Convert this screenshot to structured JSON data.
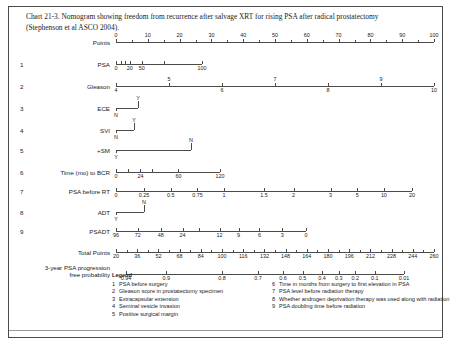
{
  "caption": "Chart 21-3. Nomogram showing freedom from recurrence after salvage XRT for rising PSA after radical prostatectomy (Stephenson et al ASCO 2004).",
  "chart_data": {
    "type": "nomogram",
    "title": "Nomogram showing freedom from recurrence after salvage XRT for rising PSA after radical prostatectomy",
    "source": "Stephenson et al ASCO 2004",
    "axes": [
      {
        "index": "",
        "label": "Points",
        "kind": "scale",
        "ticks_major": [
          0,
          10,
          20,
          30,
          40,
          50,
          60,
          70,
          80,
          90,
          100
        ],
        "tick_labels": [
          "0",
          "10",
          "20",
          "30",
          "40",
          "50",
          "60",
          "70",
          "80",
          "90",
          "100"
        ],
        "minor_step": 5,
        "label_side": "above"
      },
      {
        "index": "1",
        "label": "PSA",
        "kind": "scale",
        "tick_labels": [
          "0",
          "20",
          "50",
          "100"
        ],
        "label_side": "below"
      },
      {
        "index": "2",
        "label": "Gleason",
        "kind": "scale",
        "tick_labels": [
          "4",
          "6",
          "8",
          "10"
        ],
        "tick_labels_above": [
          "5",
          "7",
          "9"
        ],
        "label_side": "below"
      },
      {
        "index": "3",
        "label": "ECE",
        "kind": "binary",
        "low_label": "N",
        "high_label": "Y"
      },
      {
        "index": "4",
        "label": "SVI",
        "kind": "binary",
        "low_label": "N",
        "high_label": "Y"
      },
      {
        "index": "5",
        "label": "+SM",
        "kind": "binary",
        "low_label": "Y",
        "high_label": "N"
      },
      {
        "index": "6",
        "label": "Time (mo) to BCR",
        "kind": "scale",
        "tick_labels": [
          "0",
          "24",
          "60",
          "120"
        ],
        "label_side": "below"
      },
      {
        "index": "7",
        "label": "PSA before RT",
        "kind": "scale",
        "tick_labels": [
          "0",
          "0.25",
          "0.5",
          "0.75",
          "1",
          "1.5",
          "2",
          "3",
          "5",
          "10",
          "20"
        ],
        "label_side": "below"
      },
      {
        "index": "8",
        "label": "ADT",
        "kind": "binary",
        "low_label": "Y",
        "high_label": "N"
      },
      {
        "index": "9",
        "label": "PSADT",
        "kind": "scale",
        "tick_labels": [
          "96",
          "72",
          "48",
          "24",
          "12",
          "9",
          "6",
          "3",
          "0"
        ],
        "label_side": "below"
      },
      {
        "index": "",
        "label": "Total Points",
        "kind": "scale",
        "tick_labels": [
          "20",
          "36",
          "52",
          "68",
          "84",
          "100",
          "116",
          "132",
          "148",
          "164",
          "180",
          "196",
          "212",
          "228",
          "244",
          "260"
        ],
        "label_side": "below"
      },
      {
        "index": "",
        "label": "3-year PSA progression free probability",
        "kind": "scale",
        "tick_labels": [
          "0.94",
          "0.9",
          "0.8",
          "0.7",
          "0.6",
          "0.5",
          "0.4",
          "0.3",
          "0.2",
          "0.1",
          "0.01"
        ],
        "label_side": "below"
      }
    ]
  },
  "rows": {
    "points": {
      "index": "",
      "label": "Points"
    },
    "psa": {
      "index": "1",
      "label": "PSA"
    },
    "gleason": {
      "index": "2",
      "label": "Gleason"
    },
    "ece": {
      "index": "3",
      "label": "ECE"
    },
    "svi": {
      "index": "4",
      "label": "SVI"
    },
    "sm": {
      "index": "5",
      "label": "+SM"
    },
    "bcr": {
      "index": "6",
      "label": "Time (mo) to BCR"
    },
    "psart": {
      "index": "7",
      "label": "PSA before RT"
    },
    "adt": {
      "index": "8",
      "label": "ADT"
    },
    "psadt": {
      "index": "9",
      "label": "PSADT"
    },
    "total": {
      "index": "",
      "label": "Total Points"
    },
    "prob": {
      "index": "",
      "label_line1": "3-year PSA progression",
      "label_line2": "free probability"
    }
  },
  "legend": {
    "title": "Legend",
    "items_left": [
      {
        "n": "1",
        "text": "PSA before surgery"
      },
      {
        "n": "2",
        "text": "Gleason score in prostatectomy specimen"
      },
      {
        "n": "3",
        "text": "Extracapsular extension"
      },
      {
        "n": "4",
        "text": "Seminal vesicle invasion"
      },
      {
        "n": "5",
        "text": "Positive surgical margin"
      }
    ],
    "items_right": [
      {
        "n": "6",
        "text": "Time in months from surgery to first elevation in PSA"
      },
      {
        "n": "7",
        "text": "PSA level before radiation therapy"
      },
      {
        "n": "8",
        "text": "Whether androgen deprivation therapy was used along with radiation"
      },
      {
        "n": "9",
        "text": "PSA doubling time before radiation"
      }
    ]
  }
}
